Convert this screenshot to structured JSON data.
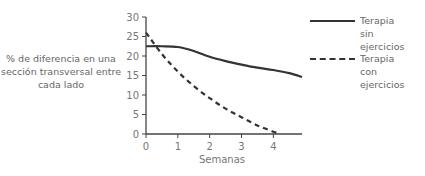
{
  "chart_data": {
    "type": "line",
    "title": "",
    "xlabel": "Semanas",
    "ylabel": "% de diferencia en una sección transversal entre cada lado",
    "ylabel_lines": [
      "% de diferencia en una",
      "sección transversal entre",
      "cada lado"
    ],
    "xlim": [
      0,
      4.9
    ],
    "ylim": [
      0,
      30
    ],
    "xticks": [
      "0",
      "1",
      "2",
      "3",
      "4"
    ],
    "yticks": [
      "0",
      "5",
      "10",
      "15",
      "20",
      "25",
      "30"
    ],
    "grid": false,
    "legend_position": "right",
    "series": [
      {
        "name": "Terapia sin ejercicios",
        "style": "solid",
        "color": "#333333",
        "x": [
          0,
          0.5,
          1,
          1.5,
          2,
          2.5,
          3,
          3.5,
          4,
          4.5,
          4.9
        ],
        "y": [
          22.5,
          22.5,
          22.3,
          21.3,
          19.8,
          18.7,
          17.8,
          17.0,
          16.4,
          15.6,
          14.6
        ]
      },
      {
        "name": "Terapia con ejercicios",
        "style": "dashed",
        "color": "#333333",
        "x": [
          0,
          0.5,
          1,
          1.5,
          2,
          2.5,
          3,
          3.5,
          4,
          4.2
        ],
        "y": [
          26,
          20.5,
          16,
          12.3,
          9.2,
          6.5,
          4.3,
          2.2,
          0.6,
          0
        ]
      }
    ]
  },
  "legend": {
    "items": [
      {
        "lines": [
          "Terapia sin",
          "ejercicios"
        ]
      },
      {
        "lines": [
          "Terapia con",
          "ejercicios"
        ]
      }
    ]
  },
  "axes": {
    "xlabel": "Semanas"
  }
}
